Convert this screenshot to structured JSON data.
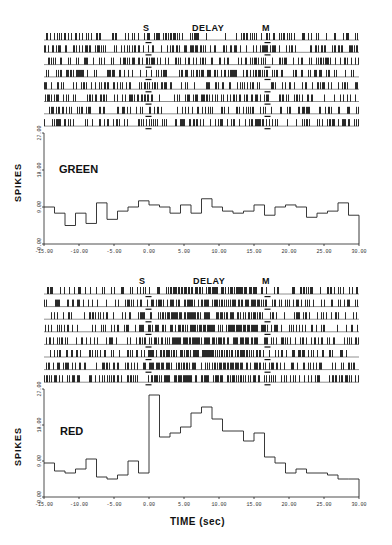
{
  "figure": {
    "x_axis_label": "TIME (sec)",
    "y_axis_label": "SPIKES",
    "event_markers": {
      "s": "S",
      "delay": "DELAY",
      "m": "M"
    }
  },
  "chart_data": [
    {
      "type": "bar",
      "style": "step-histogram with spike raster above",
      "title": "GREEN",
      "xlabel": "TIME (sec)",
      "ylabel": "SPIKES",
      "xlim": [
        -15,
        30
      ],
      "ylim": [
        0,
        27
      ],
      "x_ticks": [
        "-15.00",
        "-10.00",
        "-5.00",
        "0.00",
        "5.00",
        "10.00",
        "15.00",
        "20.00",
        "25.00",
        "30.00"
      ],
      "y_ticks": [
        "0.00",
        "9.00",
        "18.00",
        "27.00"
      ],
      "raster_trials": 8,
      "event_labels": [
        "S",
        "DELAY",
        "M"
      ],
      "bin_width": 1.5,
      "x": [
        -15,
        -13.5,
        -12,
        -10.5,
        -9,
        -7.5,
        -6,
        -4.5,
        -3,
        -1.5,
        0,
        1.5,
        3,
        4.5,
        6,
        7.5,
        9,
        10.5,
        12,
        13.5,
        15,
        16.5,
        18,
        19.5,
        21,
        22.5,
        24,
        25.5,
        27,
        28.5
      ],
      "values": [
        9,
        7.5,
        4.5,
        7.5,
        5,
        10,
        6,
        8,
        9,
        10.5,
        9.5,
        9,
        7.5,
        9.5,
        7.5,
        11,
        9,
        8,
        7.5,
        8,
        9.5,
        7,
        9,
        9.5,
        9,
        6.5,
        7.5,
        8,
        10,
        7
      ],
      "grid": false
    },
    {
      "type": "bar",
      "style": "step-histogram with spike raster above",
      "title": "RED",
      "xlabel": "TIME (sec)",
      "ylabel": "SPIKES",
      "xlim": [
        -15,
        30
      ],
      "ylim": [
        0,
        27
      ],
      "x_ticks": [
        "-15.00",
        "-10.00",
        "-5.00",
        "0.00",
        "5.00",
        "10.00",
        "15.00",
        "20.00",
        "25.00",
        "30.00"
      ],
      "y_ticks": [
        "0.00",
        "9.00",
        "18.00",
        "27.00"
      ],
      "raster_trials": 8,
      "event_labels": [
        "S",
        "DELAY",
        "M"
      ],
      "bin_width": 1.5,
      "x": [
        -15,
        -13.5,
        -12,
        -10.5,
        -9,
        -7.5,
        -6,
        -4.5,
        -3,
        -1.5,
        0,
        1.5,
        3,
        4.5,
        6,
        7.5,
        9,
        10.5,
        12,
        13.5,
        15,
        16.5,
        18,
        19.5,
        21,
        22.5,
        24,
        25.5,
        27,
        28.5
      ],
      "values": [
        8.5,
        6.5,
        6,
        7,
        9.5,
        5,
        4.5,
        5.5,
        9,
        6,
        25.5,
        15,
        16,
        17.5,
        21,
        22.5,
        19.5,
        16.5,
        16.5,
        14,
        16,
        10,
        8.5,
        6,
        7,
        6,
        6,
        5.5,
        4.5,
        4.5
      ],
      "grid": false
    }
  ],
  "panels": {
    "green": {
      "label": "GREEN"
    },
    "red": {
      "label": "RED"
    }
  },
  "ticks": {
    "x": [
      "-15.00",
      "-10.00",
      "-5.00",
      "0.00",
      "5.00",
      "10.00",
      "15.00",
      "20.00",
      "25.00",
      "30.00"
    ],
    "y": [
      "0.00",
      "9.00",
      "18.00",
      "27.00"
    ]
  }
}
